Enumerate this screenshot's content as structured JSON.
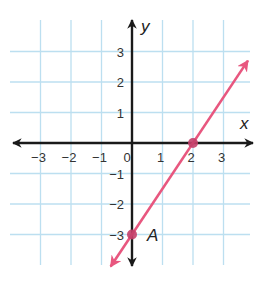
{
  "chart_data": {
    "type": "line",
    "title": "",
    "xlabel": "x",
    "ylabel": "y",
    "xlim": [
      -4,
      4
    ],
    "ylim": [
      -4,
      4
    ],
    "grid": true,
    "x_ticks": [
      -3,
      -2,
      -1,
      0,
      1,
      2,
      3
    ],
    "y_ticks": [
      3,
      2,
      1,
      -1,
      -2,
      -3
    ],
    "x_tick_labels": [
      "−3",
      "−2",
      "−1",
      "0",
      "1",
      "2",
      "3"
    ],
    "y_tick_labels": [
      "3",
      "2",
      "1",
      "−1",
      "−2",
      "−3"
    ],
    "series": [
      {
        "name": "line",
        "equation": "y = 1.5x - 3",
        "slope": 1.5,
        "intercept": -3,
        "x": [
          -0.7,
          3.8
        ],
        "y": [
          -4.05,
          2.7
        ],
        "arrows_both_ends": true
      }
    ],
    "points": [
      {
        "label": "A",
        "x": 0,
        "y": -3
      },
      {
        "label": "",
        "x": 2,
        "y": 0
      }
    ]
  },
  "colors": {
    "grid": "#bcdff0",
    "axes": "#1a1a1a",
    "line": "#e8577f",
    "point": "#c4406a"
  }
}
